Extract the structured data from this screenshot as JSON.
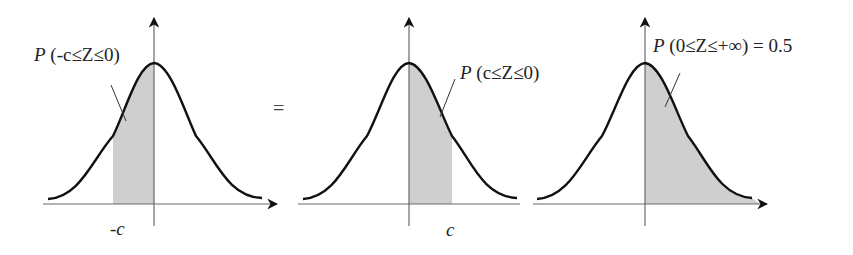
{
  "figure": {
    "equals_sign": "=",
    "panels": [
      {
        "id": "left",
        "label_P": "P",
        "label_rest": " (-c≤Z≤0)",
        "tick_label": "-c",
        "shaded_from": "-c",
        "shaded_to": "0"
      },
      {
        "id": "middle",
        "label_P": "P",
        "label_rest": " (c≤Z≤0)",
        "tick_label": "c",
        "shaded_from": "0",
        "shaded_to": "c"
      },
      {
        "id": "right",
        "label_P": "P",
        "label_rest": " (0≤Z≤+∞) = 0.5",
        "tick_label": "",
        "shaded_from": "0",
        "shaded_to": "+∞"
      }
    ],
    "colors": {
      "shade": "#cfcfcf",
      "curve": "#111111",
      "axis": "#6a6a6a"
    }
  }
}
